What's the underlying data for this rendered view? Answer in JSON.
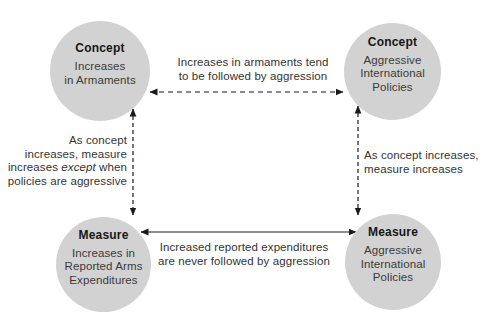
{
  "diagram": {
    "nodes": {
      "top_left": {
        "heading": "Concept",
        "body": "Increases\nin Armaments"
      },
      "top_right": {
        "heading": "Concept",
        "body": "Aggressive\nInternational\nPolicies"
      },
      "bottom_left": {
        "heading": "Measure",
        "body": "Increases in\nReported Arms\nExpenditures"
      },
      "bottom_right": {
        "heading": "Measure",
        "body": "Aggressive\nInternational\nPolicies"
      }
    },
    "edges": {
      "top": {
        "style": "dashed",
        "line1": "Increases in armaments tend",
        "line2": "to be followed by aggression"
      },
      "bottom": {
        "style": "solid",
        "line1": "Increased reported expenditures",
        "line2": "are never followed by aggression"
      },
      "left": {
        "style": "dashed",
        "line1": "As concept",
        "line2": "increases, measure",
        "line3_pre": "increases ",
        "line3_italic": "except",
        "line3_post": " when",
        "line4": "policies are aggressive"
      },
      "right": {
        "style": "dashed",
        "line1": "As concept increases,",
        "line2": "measure increases"
      }
    },
    "colors": {
      "circle_fill": "#d2d2d2",
      "line": "#1a1a1a",
      "text": "#333333"
    }
  }
}
